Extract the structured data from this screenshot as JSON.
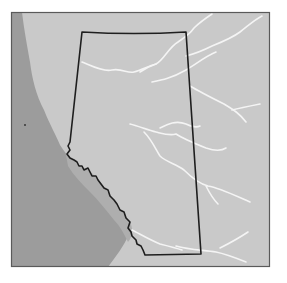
{
  "map": {
    "title": "",
    "subject": "Alberta province outline",
    "colors": {
      "page_background": "#ffffff",
      "land": "#c9c9c9",
      "mountains": "#9c9c9c",
      "foothills": "#aeaeae",
      "rivers": "#f4f4f4",
      "border": "#1e1e1e",
      "frame": "#5a5a5a"
    },
    "layers": [
      {
        "name": "land",
        "kind": "area"
      },
      {
        "name": "mountain-region",
        "kind": "area"
      },
      {
        "name": "foothills",
        "kind": "area"
      },
      {
        "name": "rivers",
        "kind": "line",
        "count": 9
      },
      {
        "name": "province-border",
        "kind": "line"
      },
      {
        "name": "map-frame",
        "kind": "frame"
      }
    ],
    "labels": []
  }
}
